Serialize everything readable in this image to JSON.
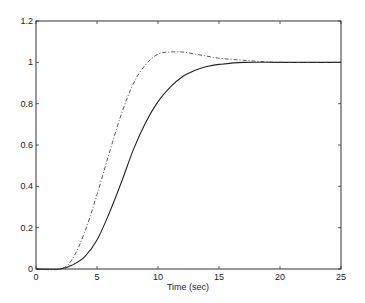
{
  "chart_data": {
    "type": "line",
    "title": "",
    "xlabel": "Time (sec)",
    "ylabel": "",
    "xlim": [
      0,
      25
    ],
    "ylim": [
      0,
      1.2
    ],
    "grid": false,
    "legend": null,
    "xticks": [
      0,
      5,
      10,
      15,
      20,
      25
    ],
    "xtick_labels": [
      "0",
      "5",
      "10",
      "15",
      "20",
      "25"
    ],
    "yticks": [
      0,
      0.2,
      0.4,
      0.6,
      0.8,
      1,
      1.2
    ],
    "ytick_labels": [
      "0",
      "0.2",
      "0.4",
      "0.6",
      "0.8",
      "1",
      "1.2"
    ],
    "series": [
      {
        "name": "solid",
        "style": "solid",
        "color": "#222222",
        "x": [
          0,
          2,
          3,
          4,
          5,
          6,
          7,
          8,
          9,
          10,
          11,
          12,
          13,
          14,
          15,
          17,
          20,
          25
        ],
        "y": [
          0,
          0,
          0.02,
          0.06,
          0.14,
          0.27,
          0.42,
          0.58,
          0.71,
          0.81,
          0.88,
          0.93,
          0.96,
          0.98,
          0.99,
          1.0,
          1.0,
          1.0
        ]
      },
      {
        "name": "dash-dot",
        "style": "dashdot",
        "color": "#444444",
        "x": [
          0,
          2,
          3,
          4,
          5,
          6,
          7,
          8,
          9,
          10,
          11,
          12,
          13,
          14,
          15,
          17,
          20,
          25
        ],
        "y": [
          0,
          0,
          0.05,
          0.18,
          0.36,
          0.56,
          0.75,
          0.9,
          0.99,
          1.04,
          1.05,
          1.05,
          1.04,
          1.03,
          1.02,
          1.01,
          1.0,
          1.0
        ]
      }
    ]
  }
}
